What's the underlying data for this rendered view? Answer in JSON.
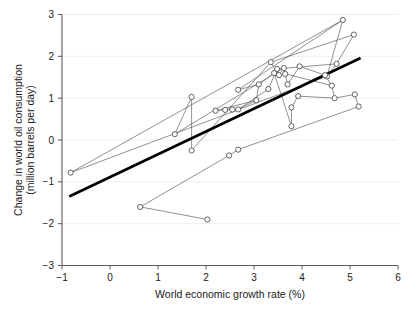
{
  "chart_data": {
    "type": "scatter",
    "title": "",
    "xlabel": "World economic growth rate (%)",
    "ylabel": "Change in world oil consumption\n(million barrels per day)",
    "ylabel_line1": "Change in world oil consumption",
    "ylabel_line2": "(million barrels per day)",
    "xlim": [
      -1,
      6
    ],
    "ylim": [
      -3,
      3
    ],
    "xticks": [
      -1,
      0,
      1,
      2,
      3,
      4,
      5,
      6
    ],
    "xtick_labels": [
      "−1",
      "0",
      "1",
      "2",
      "3",
      "4",
      "5",
      "6"
    ],
    "yticks": [
      -3,
      -2,
      -1,
      0,
      1,
      2,
      3
    ],
    "ytick_labels": [
      "−3",
      "−2",
      "−1",
      "0",
      "1",
      "2",
      "3"
    ],
    "grid": "horizontal-only",
    "legend": "none",
    "marker_style": "open-circle",
    "connected": true,
    "series": [
      {
        "name": "world-oil-consumption-vs-growth",
        "note": "Points joined in chronological order by thin line segments",
        "points": [
          [
            -0.82,
            -0.78
          ],
          [
            2.48,
            -0.37
          ],
          [
            0.63,
            -1.6
          ],
          [
            2.03,
            -1.9
          ],
          [
            4.52,
            1.52
          ],
          [
            1.35,
            0.14
          ],
          [
            1.7,
            1.03
          ],
          [
            1.7,
            -0.25
          ],
          [
            2.67,
            1.2
          ],
          [
            2.67,
            0.73
          ],
          [
            2.2,
            0.7
          ],
          [
            2.4,
            0.72
          ],
          [
            2.55,
            0.73
          ],
          [
            3.1,
            1.33
          ],
          [
            3.05,
            0.95
          ],
          [
            3.35,
            1.86
          ],
          [
            3.42,
            1.6
          ],
          [
            3.3,
            1.22
          ],
          [
            3.48,
            1.7
          ],
          [
            3.52,
            1.55
          ],
          [
            3.62,
            1.72
          ],
          [
            3.65,
            1.58
          ],
          [
            3.7,
            1.33
          ],
          [
            3.78,
            0.78
          ],
          [
            3.78,
            0.33
          ],
          [
            3.95,
            1.76
          ],
          [
            3.92,
            1.05
          ],
          [
            4.48,
            1.55
          ],
          [
            4.62,
            1.3
          ],
          [
            4.68,
            1.0
          ],
          [
            4.72,
            1.82
          ],
          [
            4.85,
            2.87
          ],
          [
            5.08,
            2.52
          ],
          [
            5.1,
            1.09
          ],
          [
            5.18,
            0.8
          ],
          [
            2.67,
            -0.23
          ]
        ],
        "paths": [
          [
            [
              -0.82,
              -0.78
            ],
            [
              4.52,
              1.52
            ]
          ],
          [
            [
              -0.82,
              -0.78
            ],
            [
              4.85,
              2.87
            ]
          ],
          [
            [
              0.63,
              -1.6
            ],
            [
              2.03,
              -1.9
            ]
          ],
          [
            [
              0.63,
              -1.6
            ],
            [
              2.48,
              -0.37
            ]
          ],
          [
            [
              2.48,
              -0.37
            ],
            [
              2.67,
              -0.23
            ]
          ],
          [
            [
              2.67,
              -0.23
            ],
            [
              5.18,
              0.8
            ]
          ],
          [
            [
              1.35,
              0.14
            ],
            [
              1.7,
              1.03
            ]
          ],
          [
            [
              1.7,
              1.03
            ],
            [
              1.7,
              -0.25
            ]
          ],
          [
            [
              1.7,
              -0.25
            ],
            [
              3.35,
              1.86
            ]
          ],
          [
            [
              1.35,
              0.14
            ],
            [
              3.62,
              1.72
            ]
          ],
          [
            [
              2.2,
              0.7
            ],
            [
              2.4,
              0.72
            ]
          ],
          [
            [
              2.4,
              0.72
            ],
            [
              2.55,
              0.73
            ]
          ],
          [
            [
              2.55,
              0.73
            ],
            [
              2.67,
              0.73
            ]
          ],
          [
            [
              2.67,
              0.73
            ],
            [
              3.05,
              0.95
            ]
          ],
          [
            [
              3.05,
              0.95
            ],
            [
              3.1,
              1.33
            ]
          ],
          [
            [
              2.67,
              1.2
            ],
            [
              3.1,
              1.33
            ]
          ],
          [
            [
              3.1,
              1.33
            ],
            [
              3.42,
              1.6
            ]
          ],
          [
            [
              3.3,
              1.22
            ],
            [
              3.48,
              1.7
            ]
          ],
          [
            [
              3.35,
              1.86
            ],
            [
              3.52,
              1.55
            ]
          ],
          [
            [
              3.52,
              1.55
            ],
            [
              3.62,
              1.72
            ]
          ],
          [
            [
              3.62,
              1.72
            ],
            [
              3.65,
              1.58
            ]
          ],
          [
            [
              3.65,
              1.58
            ],
            [
              3.7,
              1.33
            ]
          ],
          [
            [
              3.7,
              1.33
            ],
            [
              3.95,
              1.76
            ]
          ],
          [
            [
              3.78,
              0.78
            ],
            [
              3.92,
              1.05
            ]
          ],
          [
            [
              3.78,
              0.33
            ],
            [
              3.78,
              0.78
            ]
          ],
          [
            [
              3.42,
              1.6
            ],
            [
              3.78,
              0.33
            ]
          ],
          [
            [
              3.95,
              1.76
            ],
            [
              4.48,
              1.55
            ]
          ],
          [
            [
              4.48,
              1.55
            ],
            [
              4.62,
              1.3
            ]
          ],
          [
            [
              4.62,
              1.3
            ],
            [
              4.68,
              1.0
            ]
          ],
          [
            [
              4.68,
              1.0
            ],
            [
              5.1,
              1.09
            ]
          ],
          [
            [
              5.1,
              1.09
            ],
            [
              5.18,
              0.8
            ]
          ],
          [
            [
              4.52,
              1.52
            ],
            [
              4.72,
              1.82
            ]
          ],
          [
            [
              4.72,
              1.82
            ],
            [
              5.08,
              2.52
            ]
          ],
          [
            [
              4.85,
              2.87
            ],
            [
              4.52,
              1.52
            ]
          ],
          [
            [
              3.35,
              1.86
            ],
            [
              5.08,
              2.52
            ]
          ],
          [
            [
              2.67,
              1.2
            ],
            [
              4.85,
              2.87
            ]
          ],
          [
            [
              3.48,
              1.7
            ],
            [
              4.72,
              1.82
            ]
          ],
          [
            [
              2.67,
              0.73
            ],
            [
              3.3,
              1.22
            ]
          ],
          [
            [
              3.92,
              1.05
            ],
            [
              4.68,
              1.0
            ]
          ],
          [
            [
              2.2,
              0.7
            ],
            [
              3.05,
              0.95
            ]
          ],
          [
            [
              3.65,
              1.58
            ],
            [
              4.62,
              1.3
            ]
          ]
        ]
      }
    ],
    "trend_line": {
      "name": "fitted-regression-line",
      "x0": -0.85,
      "y0": -1.35,
      "x1": 5.22,
      "y1": 1.96
    }
  }
}
